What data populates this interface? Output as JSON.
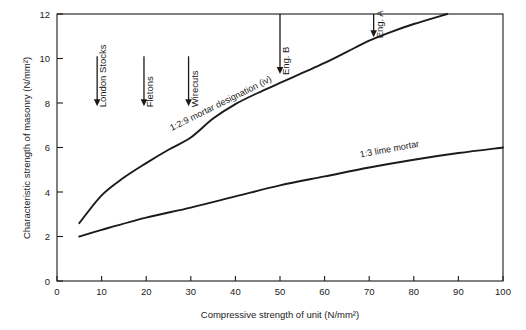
{
  "chart_data": {
    "type": "line",
    "title": "",
    "xlabel": "Compressive strength of unit (N/mm²)",
    "ylabel": "Characteristic strength of masonry (N/mm²)",
    "xlim": [
      0,
      100
    ],
    "ylim": [
      0,
      12
    ],
    "xticks": [
      0,
      10,
      20,
      30,
      40,
      50,
      60,
      70,
      80,
      90,
      100
    ],
    "yticks": [
      0,
      2,
      4,
      6,
      8,
      10,
      12
    ],
    "xtick_labels": [
      "0",
      "10",
      "20",
      "30",
      "40",
      "50",
      "60",
      "70",
      "80",
      "90",
      "100"
    ],
    "ytick_labels": [
      "0",
      "2",
      "4",
      "6",
      "8",
      "10",
      "12"
    ],
    "grid": false,
    "legend": "inline-curve-labels",
    "series": [
      {
        "name": "1:2:9 mortar designation (iv)",
        "label": "1:2:9 mortar designation (iv)",
        "points": [
          [
            5,
            2.6
          ],
          [
            10,
            3.85
          ],
          [
            15,
            4.65
          ],
          [
            20,
            5.3
          ],
          [
            25,
            5.9
          ],
          [
            30,
            6.45
          ],
          [
            35,
            7.3
          ],
          [
            40,
            7.95
          ],
          [
            45,
            8.45
          ],
          [
            50,
            8.9
          ],
          [
            55,
            9.35
          ],
          [
            60,
            9.8
          ],
          [
            65,
            10.3
          ],
          [
            70,
            10.8
          ],
          [
            75,
            11.2
          ],
          [
            80,
            11.55
          ],
          [
            87.5,
            12.0
          ]
        ]
      },
      {
        "name": "1:3 lime mortar",
        "label": "1:3 lime mortar",
        "points": [
          [
            5,
            2.0
          ],
          [
            10,
            2.3
          ],
          [
            20,
            2.85
          ],
          [
            30,
            3.3
          ],
          [
            40,
            3.8
          ],
          [
            50,
            4.3
          ],
          [
            60,
            4.7
          ],
          [
            70,
            5.1
          ],
          [
            80,
            5.45
          ],
          [
            90,
            5.75
          ],
          [
            100,
            6.0
          ]
        ]
      }
    ],
    "annotations": [
      {
        "label": "London Stocks",
        "x": 9,
        "y_top": 10.1,
        "y_tip": 7.85
      },
      {
        "label": "Fletons",
        "x": 19.5,
        "y_top": 10.1,
        "y_tip": 7.85
      },
      {
        "label": "Wirecuts",
        "x": 29.5,
        "y_top": 10.1,
        "y_tip": 7.85
      },
      {
        "label": "Eng. B",
        "x": 50,
        "y_top": 12.0,
        "y_tip": 9.3
      },
      {
        "label": "Eng. A",
        "x": 71,
        "y_top": 12.0,
        "y_tip": 10.95
      }
    ]
  },
  "colors": {
    "ink": "#1a1a1a",
    "background": "#ffffff"
  }
}
